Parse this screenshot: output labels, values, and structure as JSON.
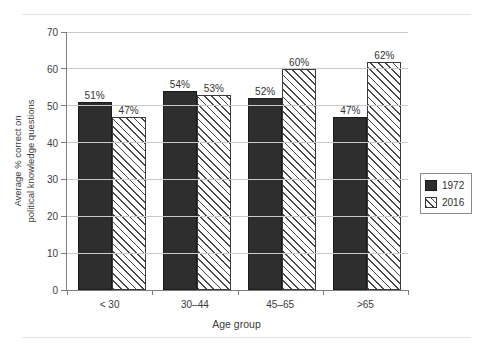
{
  "page": {
    "cutoff_text_above": "",
    "rule_color": "#e2e2e2"
  },
  "chart_data": {
    "type": "bar",
    "title": "",
    "xlabel": "Age group",
    "ylabel": "Average % correct on political knowledge questions",
    "ylabel_line1": "Average % correct on",
    "ylabel_line2": "political knowledge questions",
    "categories": [
      "< 30",
      "30–44",
      "45–65",
      ">65"
    ],
    "series": [
      {
        "name": "1972",
        "color": "#2e2e2e",
        "fill": "solid",
        "values": [
          51,
          54,
          52,
          47
        ],
        "value_labels": [
          "51%",
          "54%",
          "52%",
          "47%"
        ]
      },
      {
        "name": "2016",
        "color": "#4a4a4a",
        "fill": "diagonal-hatch",
        "values": [
          47,
          53,
          60,
          62
        ],
        "value_labels": [
          "47%",
          "53%",
          "60%",
          "62%"
        ]
      }
    ],
    "ylim": [
      0,
      70
    ],
    "yticks": [
      0,
      10,
      20,
      30,
      40,
      50,
      60,
      70
    ],
    "ytick_labels": [
      "0",
      "10",
      "20",
      "30",
      "40",
      "50",
      "60",
      "70"
    ],
    "grid": true,
    "grid_axis": "y",
    "legend_position": "right",
    "legend_entries": [
      "1972",
      "2016"
    ]
  }
}
